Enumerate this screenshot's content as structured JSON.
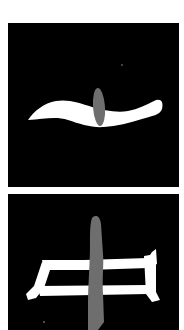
{
  "figure": {
    "background": "#ffffff",
    "panel_color": "#000000",
    "stroke_color": "#ffffff",
    "highlight_color": "#6e6e6e",
    "panels": [
      {
        "label": "Character 一 with highlighted vertical stroke segment",
        "character": "一"
      },
      {
        "label": "Character 中 with highlighted vertical stroke",
        "character": "中"
      }
    ]
  }
}
